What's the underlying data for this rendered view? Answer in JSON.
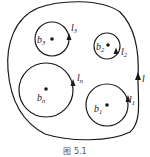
{
  "figure": {
    "caption": "图 5.1",
    "outer_contour": {
      "label": "l",
      "direction": "counterclockwise"
    },
    "holes": [
      {
        "point": "b",
        "point_sub": "3",
        "contour": "l",
        "contour_sub": "3",
        "cx": 52,
        "cy": 39,
        "r": 17
      },
      {
        "point": "b",
        "point_sub": "2",
        "contour": "l",
        "contour_sub": "2",
        "cx": 107,
        "cy": 46,
        "r": 13
      },
      {
        "point": "b",
        "point_sub": "n",
        "contour": "l",
        "contour_sub": "n",
        "cx": 46,
        "cy": 90,
        "r": 27
      },
      {
        "point": "b",
        "point_sub": "1",
        "contour": "l",
        "contour_sub": "1",
        "cx": 107,
        "cy": 105,
        "r": 21
      }
    ],
    "colors": {
      "stroke": "#1a1a1a",
      "background": "#ffffff"
    }
  }
}
